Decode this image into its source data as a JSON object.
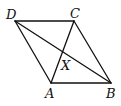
{
  "diagram": {
    "points": {
      "A": {
        "label": "A",
        "x": 51,
        "y": 83
      },
      "B": {
        "label": "B",
        "x": 111,
        "y": 83
      },
      "C": {
        "label": "C",
        "x": 74,
        "y": 21
      },
      "D": {
        "label": "D",
        "x": 15,
        "y": 21
      },
      "X": {
        "label": "X",
        "x": 62.5,
        "y": 52
      }
    },
    "segments": [
      [
        "D",
        "C"
      ],
      [
        "C",
        "B"
      ],
      [
        "B",
        "A"
      ],
      [
        "A",
        "D"
      ],
      [
        "A",
        "C"
      ],
      [
        "D",
        "B"
      ]
    ],
    "stroke_color": "#111111"
  }
}
